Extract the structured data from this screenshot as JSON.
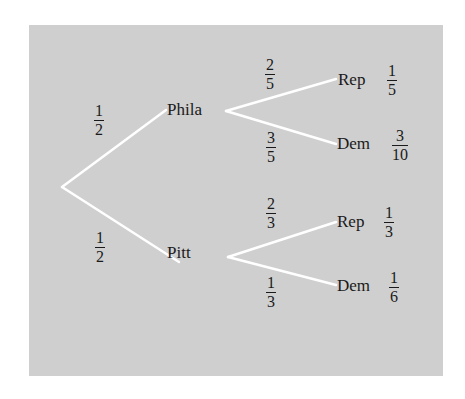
{
  "diagram": {
    "type": "probability-tree",
    "colors": {
      "panel": "#cfcfcf",
      "edge": "#ffffff",
      "text": "#1a1a1a"
    },
    "root": {
      "x": 62,
      "y": 187
    },
    "level1": [
      {
        "id": "phila",
        "label": "Phila",
        "x": 167,
        "y": 101,
        "edge_prob": {
          "num": "1",
          "den": "2",
          "x": 99,
          "y": 103
        },
        "edge": {
          "x1": 62,
          "y1": 187,
          "x2": 166,
          "y2": 110
        }
      },
      {
        "id": "pitt",
        "label": "Pitt",
        "x": 167,
        "y": 244,
        "edge_prob": {
          "num": "1",
          "den": "2",
          "x": 100,
          "y": 230
        },
        "edge": {
          "x1": 62,
          "y1": 187,
          "x2": 179,
          "y2": 262
        }
      }
    ],
    "level2": [
      {
        "parent": "phila",
        "label": "Rep",
        "x": 338,
        "y": 71,
        "edge_prob": {
          "num": "2",
          "den": "5",
          "x": 270,
          "y": 57
        },
        "edge": {
          "x1": 226,
          "y1": 111,
          "x2": 336,
          "y2": 79
        },
        "joint": {
          "num": "1",
          "den": "5",
          "x": 392,
          "y": 63
        }
      },
      {
        "parent": "phila",
        "label": "Dem",
        "x": 337,
        "y": 135,
        "edge_prob": {
          "num": "3",
          "den": "5",
          "x": 271,
          "y": 130
        },
        "edge": {
          "x1": 226,
          "y1": 111,
          "x2": 336,
          "y2": 144
        },
        "joint": {
          "num": "3",
          "den": "10",
          "x": 400,
          "y": 128
        }
      },
      {
        "parent": "pitt",
        "label": "Rep",
        "x": 337,
        "y": 213,
        "edge_prob": {
          "num": "2",
          "den": "3",
          "x": 271,
          "y": 196
        },
        "edge": {
          "x1": 228,
          "y1": 257,
          "x2": 336,
          "y2": 222
        },
        "joint": {
          "num": "1",
          "den": "3",
          "x": 389,
          "y": 205
        }
      },
      {
        "parent": "pitt",
        "label": "Dem",
        "x": 337,
        "y": 277,
        "edge_prob": {
          "num": "1",
          "den": "3",
          "x": 271,
          "y": 275
        },
        "edge": {
          "x1": 228,
          "y1": 257,
          "x2": 336,
          "y2": 285
        },
        "joint": {
          "num": "1",
          "den": "6",
          "x": 394,
          "y": 270
        }
      }
    ]
  }
}
